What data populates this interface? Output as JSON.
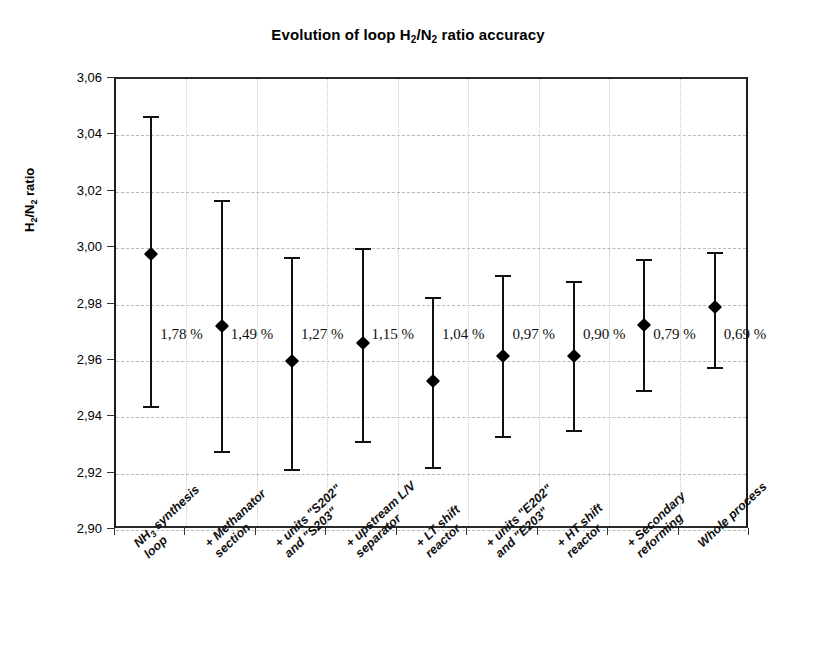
{
  "chart_data": {
    "type": "scatter",
    "title": "Evolution of loop H2/N2 ratio accuracy",
    "title_parts": {
      "pre": "Evolution of loop H",
      "sub1": "2",
      "mid": "/N",
      "sub2": "2",
      "post": " ratio accuracy"
    },
    "xlabel": "",
    "ylabel": "H2/N2 ratio",
    "ylabel_parts": {
      "pre": "H",
      "sub1": "2",
      "mid": "/N",
      "sub2": "2",
      "post": " ratio"
    },
    "ylim": [
      2.9,
      3.06
    ],
    "ytick_labels": [
      "3,06",
      "3,04",
      "3,02",
      "3,00",
      "2,98",
      "2,96",
      "2,94",
      "2,92",
      "2,90"
    ],
    "ytick_values": [
      3.06,
      3.04,
      3.02,
      3.0,
      2.98,
      2.96,
      2.94,
      2.92,
      2.9
    ],
    "grid": true,
    "legend": "none",
    "decimal_separator": ",",
    "categories": [
      "NH3 synthesis loop",
      "+ Methanator section",
      "+ units \"S202\" and \"S203\"",
      "+ upstream L/V separator",
      "+ LT shift reactor",
      "+ units \"E202\" and \"E203\"",
      "+ HT shift reactor",
      "+ Secondary reforming",
      "Whole process"
    ],
    "category_label_lines": [
      [
        "NH3 synthesis",
        "loop"
      ],
      [
        "+ Methanator",
        "section"
      ],
      [
        "+ units \"S202\"",
        "and \"S203\""
      ],
      [
        "+ upstream L/V",
        "separator"
      ],
      [
        "+ LT shift",
        "reactor"
      ],
      [
        "+ units \"E202\"",
        "and \"E203\""
      ],
      [
        "+ HT shift",
        "reactor"
      ],
      [
        "+ Secondary",
        "reforming"
      ],
      [
        "Whole process",
        ""
      ]
    ],
    "values": [
      2.998,
      2.9725,
      2.96,
      2.9665,
      2.953,
      2.9618,
      2.9618,
      2.9728,
      2.979
    ],
    "error_low": [
      2.944,
      2.928,
      2.9215,
      2.9315,
      2.9225,
      2.9332,
      2.9355,
      2.9495,
      2.9578
    ],
    "error_high": [
      3.047,
      3.017,
      2.997,
      3.0,
      2.9825,
      2.9905,
      2.9885,
      2.9962,
      2.9988
    ],
    "accuracy_labels": [
      "1,78 %",
      "1,49 %",
      "1,27 %",
      "1,15 %",
      "1,04 %",
      "0,97 %",
      "0,90 %",
      "0,79 %",
      "0,69 %"
    ],
    "marker": "diamond",
    "colors": {
      "marker": "#000000",
      "errorbar": "#111111",
      "grid": "#b9b9b9",
      "axis": "#1c1c1c",
      "background": "#ffffff"
    }
  }
}
